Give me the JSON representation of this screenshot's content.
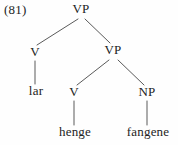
{
  "figure": {
    "example_number": "(81)",
    "line_color": "#5a5a5a",
    "text_color": "#232323",
    "background": "#fefefe"
  },
  "tree": {
    "nodes": [
      {
        "id": "vp-root",
        "label": "VP",
        "x": 81,
        "y": 14
      },
      {
        "id": "v-upper",
        "label": "V",
        "x": 35,
        "y": 57
      },
      {
        "id": "vp-inner",
        "label": "VP",
        "x": 113,
        "y": 55
      },
      {
        "id": "v-lower",
        "label": "V",
        "x": 74,
        "y": 97
      },
      {
        "id": "np",
        "label": "NP",
        "x": 147,
        "y": 97
      }
    ],
    "leaves": [
      {
        "id": "leaf-lar",
        "label": "lar",
        "x": 36,
        "y": 96
      },
      {
        "id": "leaf-henge",
        "label": "henge",
        "x": 75,
        "y": 137
      },
      {
        "id": "leaf-fangene",
        "label": "fangene",
        "x": 148,
        "y": 137
      }
    ],
    "edges": [
      {
        "id": "edge-vproot-v",
        "x1": 78,
        "y1": 19,
        "x2": 37,
        "y2": 45
      },
      {
        "id": "edge-vproot-vpinner",
        "x1": 85,
        "y1": 19,
        "x2": 110,
        "y2": 43
      },
      {
        "id": "edge-v-lar",
        "x1": 35,
        "y1": 61,
        "x2": 35,
        "y2": 84
      },
      {
        "id": "edge-vpinner-v",
        "x1": 109,
        "y1": 60,
        "x2": 77,
        "y2": 85
      },
      {
        "id": "edge-vpinner-np",
        "x1": 118,
        "y1": 60,
        "x2": 144,
        "y2": 85
      },
      {
        "id": "edge-v-henge",
        "x1": 74,
        "y1": 101,
        "x2": 74,
        "y2": 125
      },
      {
        "id": "edge-np-fangene",
        "x1": 147,
        "y1": 101,
        "x2": 147,
        "y2": 125
      }
    ]
  }
}
